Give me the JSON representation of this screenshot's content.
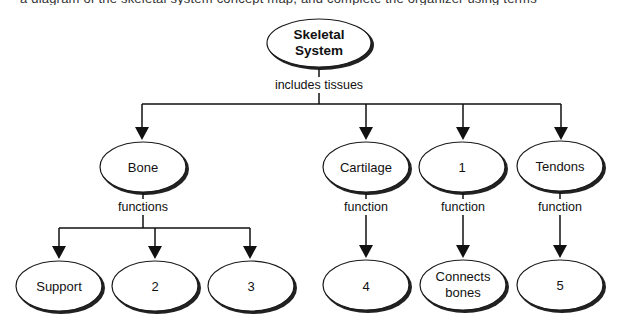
{
  "header": {
    "clipped_text": "a diagram of the skeletal system concept map, and complete the organizer using terms"
  },
  "diagram": {
    "root": {
      "label_line1": "Skeletal",
      "label_line2": "System"
    },
    "root_link_label": "includes tissues",
    "tissues": [
      {
        "id": "bone",
        "label": "Bone",
        "link_label": "functions"
      },
      {
        "id": "cartilage",
        "label": "Cartilage",
        "link_label": "function"
      },
      {
        "id": "blank-1",
        "label": "1",
        "link_label": "function"
      },
      {
        "id": "tendons",
        "label": "Tendons",
        "link_label": "function"
      }
    ],
    "leaves": [
      {
        "parent": "bone",
        "label_line1": "Support",
        "label_line2": ""
      },
      {
        "parent": "bone",
        "label_line1": "2",
        "label_line2": ""
      },
      {
        "parent": "bone",
        "label_line1": "3",
        "label_line2": ""
      },
      {
        "parent": "cartilage",
        "label_line1": "4",
        "label_line2": ""
      },
      {
        "parent": "blank-1",
        "label_line1": "Connects",
        "label_line2": "bones"
      },
      {
        "parent": "tendons",
        "label_line1": "5",
        "label_line2": ""
      }
    ]
  }
}
